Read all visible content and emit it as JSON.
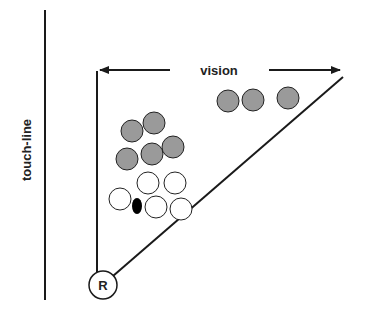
{
  "labels": {
    "touchline": "touch-line",
    "vision": "vision",
    "referee": "R"
  },
  "colors": {
    "line": "#1a1a1a",
    "teamA": "#9a9a9a",
    "teamB": "#ffffff",
    "ball": "#000000"
  },
  "players": {
    "grey": [
      {
        "cx": 228,
        "cy": 101
      },
      {
        "cx": 253,
        "cy": 100
      },
      {
        "cx": 288,
        "cy": 98
      },
      {
        "cx": 132,
        "cy": 131
      },
      {
        "cx": 154,
        "cy": 123
      },
      {
        "cx": 127,
        "cy": 159
      },
      {
        "cx": 152,
        "cy": 154
      },
      {
        "cx": 173,
        "cy": 147
      }
    ],
    "white": [
      {
        "cx": 148,
        "cy": 183
      },
      {
        "cx": 175,
        "cy": 183
      },
      {
        "cx": 120,
        "cy": 199
      },
      {
        "cx": 156,
        "cy": 207
      },
      {
        "cx": 181,
        "cy": 209
      }
    ]
  }
}
